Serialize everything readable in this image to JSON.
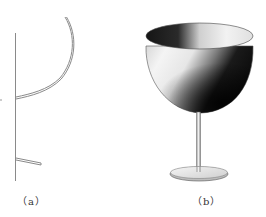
{
  "figure": {
    "panels": [
      {
        "id": "a",
        "label": "（a）",
        "description": "2D profile curve of wine glass with axis of revolution",
        "stroke_color": "#8a8a8a"
      },
      {
        "id": "b",
        "label": "（b）",
        "description": "3D surface of revolution rendering of a wine glass",
        "shade_dark": "#111111",
        "shade_light": "#f2f2f2"
      }
    ]
  }
}
